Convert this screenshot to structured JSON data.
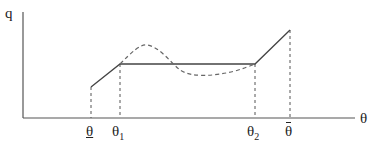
{
  "axes": {
    "y_label": "q",
    "x_label": "θ"
  },
  "tick_labels": {
    "theta_low": "θ",
    "theta_1": "θ",
    "theta_1_sub": "1",
    "theta_2": "θ",
    "theta_2_sub": "2",
    "theta_high": "θ"
  },
  "colors": {
    "axis": "#555555",
    "solid_curve": "#444444",
    "dashed_curve": "#666666"
  }
}
